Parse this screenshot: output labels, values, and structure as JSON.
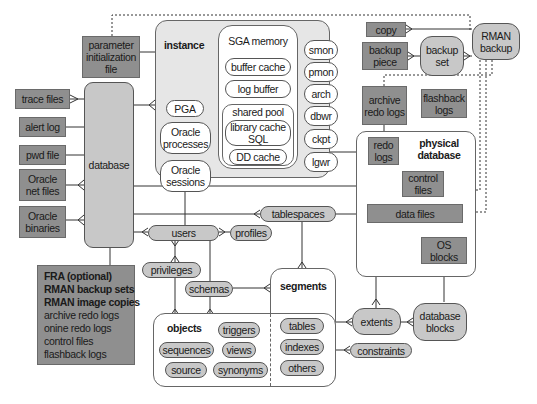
{
  "diagram": {
    "colors": {
      "dark_box": "#8f8f8f",
      "light_pill": "#c8c8c8",
      "instance_bg": "#e6e6e6",
      "line": "#333333"
    },
    "files": {
      "parameter_file": "parameter initialization file",
      "trace_files": "trace files",
      "alert_log": "alert log",
      "pwd_file": "pwd file",
      "oracle_net_files": "Oracle net files",
      "oracle_binaries": "Oracle binaries"
    },
    "database": "database",
    "instance": {
      "title": "instance",
      "pga": "PGA",
      "oracle_processes": "Oracle processes",
      "oracle_sessions": "Oracle sessions",
      "sga": {
        "title": "SGA memory",
        "buffer_cache": "buffer cache",
        "log_buffer": "log buffer",
        "shared_pool": "shared pool",
        "library_cache": "library cache SQL",
        "dd_cache": "DD cache"
      },
      "background": [
        "smon",
        "pmon",
        "arch",
        "dbwr",
        "ckpt",
        "lgwr"
      ]
    },
    "backup": {
      "copy": "copy",
      "backup_piece": "backup piece",
      "backup_set": "backup set",
      "rman_backup": "RMAN backup"
    },
    "logs": {
      "archive_redo_logs": "archive redo logs",
      "flashback_logs": "flashback logs"
    },
    "physical": {
      "title": "physical database",
      "redo_logs": "redo logs",
      "control_files": "control files",
      "data_files": "data files",
      "os_blocks": "OS blocks"
    },
    "logical": {
      "users": "users",
      "profiles": "profiles",
      "tablespaces": "tablespaces",
      "privileges": "privileges",
      "schemas": "schemas",
      "segments": {
        "title": "segments",
        "items": [
          "tables",
          "indexes",
          "others"
        ]
      },
      "objects": {
        "title": "objects",
        "items": [
          "triggers",
          "sequences",
          "views",
          "source",
          "synonyms"
        ]
      },
      "extents": "extents",
      "database_blocks": "database blocks",
      "constraints": "constraints"
    },
    "fra": {
      "title": "FRA (optional)",
      "items": [
        "RMAN backup sets",
        "RMAN image copies",
        "archive redo logs",
        "onine redo logs",
        "control files",
        "flashback logs"
      ]
    }
  }
}
